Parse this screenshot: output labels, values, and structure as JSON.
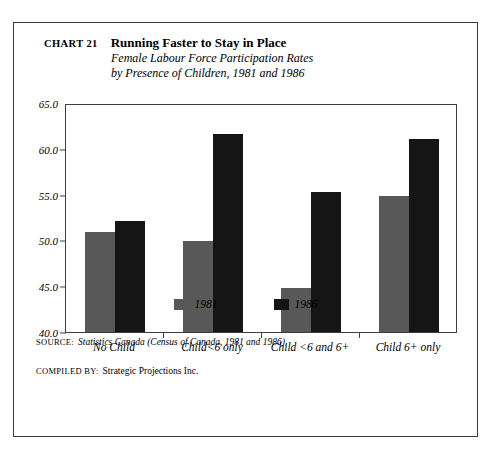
{
  "figure": {
    "chart_number": "CHART 21",
    "title": "Running Faster to Stay in Place",
    "subtitle_line1": "Female Labour Force Participation Rates",
    "subtitle_line2": "by Presence of Children, 1981 and 1986"
  },
  "legend": {
    "items": [
      {
        "label": "1981",
        "color": "#585858"
      },
      {
        "label": "1986",
        "color": "#151515"
      }
    ]
  },
  "notes": [
    {
      "label": "Source:",
      "body": "Statistics Canada (Census of Canada, 1981 and 1986).",
      "italic": true
    },
    {
      "label": "Compiled by:",
      "body": "Strategic Projections Inc.",
      "italic": false
    }
  ],
  "chart_data": {
    "type": "bar",
    "title": "Running Faster to Stay in Place",
    "subtitle": "Female Labour Force Participation Rates by Presence of Children, 1981 and 1986",
    "xlabel": "",
    "ylabel": "",
    "ylim": [
      40.0,
      65.0
    ],
    "yticks": [
      40.0,
      45.0,
      50.0,
      55.0,
      60.0,
      65.0
    ],
    "ytick_labels": [
      "40.0",
      "45.0",
      "50.0",
      "55.0",
      "60.0",
      "65.0"
    ],
    "grid": false,
    "legend_position": "bottom-center",
    "categories": [
      "No Child",
      "Child<6 only",
      "Child <6 and 6+",
      "Child 6+ only"
    ],
    "series": [
      {
        "name": "1981",
        "color": "#585858",
        "values": [
          51.0,
          50.0,
          44.8,
          55.0
        ]
      },
      {
        "name": "1986",
        "color": "#151515",
        "values": [
          52.2,
          61.8,
          55.4,
          61.3
        ]
      }
    ]
  }
}
